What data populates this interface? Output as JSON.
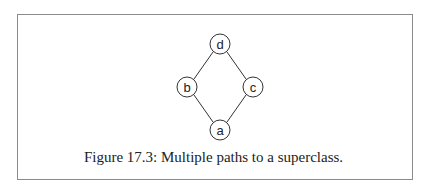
{
  "figure": {
    "caption": "Figure 17.3: Multiple paths to a superclass.",
    "nodes": [
      {
        "id": "d",
        "label": "d"
      },
      {
        "id": "b",
        "label": "b"
      },
      {
        "id": "c",
        "label": "c"
      },
      {
        "id": "a",
        "label": "a"
      }
    ],
    "edges": [
      [
        "d",
        "b"
      ],
      [
        "d",
        "c"
      ],
      [
        "b",
        "a"
      ],
      [
        "c",
        "a"
      ]
    ],
    "colors": {
      "stroke": "#333333",
      "frame": "#8a8a8a"
    }
  }
}
